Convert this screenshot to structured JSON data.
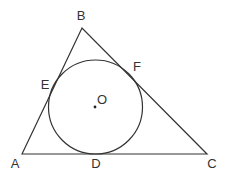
{
  "diagram": {
    "stroke_color": "#333333",
    "background": "#ffffff",
    "points": {
      "A": {
        "x": 22,
        "y": 154
      },
      "B": {
        "x": 82,
        "y": 28
      },
      "C": {
        "x": 207,
        "y": 154
      },
      "O": {
        "x": 95,
        "y": 107
      }
    },
    "circle": {
      "cx": 95.5,
      "cy": 107,
      "r": 47
    },
    "labels": [
      {
        "id": "A",
        "text": "A",
        "x": 15,
        "y": 163
      },
      {
        "id": "B",
        "text": "B",
        "x": 81,
        "y": 15
      },
      {
        "id": "C",
        "text": "C",
        "x": 212,
        "y": 163
      },
      {
        "id": "D",
        "text": "D",
        "x": 96,
        "y": 163
      },
      {
        "id": "E",
        "text": "E",
        "x": 45,
        "y": 84
      },
      {
        "id": "F",
        "text": "F",
        "x": 137,
        "y": 66
      },
      {
        "id": "O",
        "text": "O",
        "x": 102,
        "y": 99
      }
    ]
  }
}
